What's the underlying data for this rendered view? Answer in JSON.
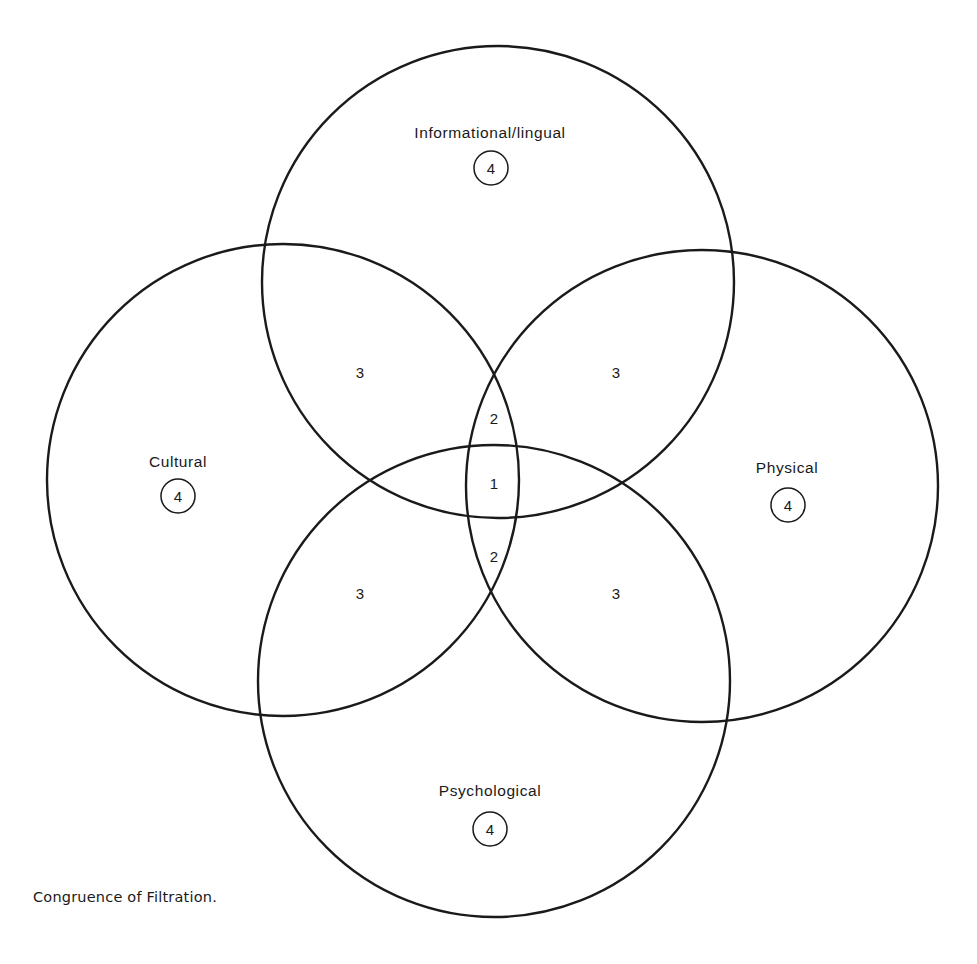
{
  "diagram": {
    "type": "venn",
    "caption": "Congruence of Filtration.",
    "line_color": "#1a1a1a",
    "background": "#ffffff",
    "sets": [
      {
        "id": "informational",
        "label": "Informational/lingual",
        "badge": "4",
        "cx": 498,
        "cy": 282,
        "r": 236,
        "label_x": 490,
        "label_y": 138,
        "badge_x": 491,
        "badge_y": 168
      },
      {
        "id": "cultural",
        "label": "Cultural",
        "badge": "4",
        "cx": 283,
        "cy": 480,
        "r": 236,
        "label_x": 178,
        "label_y": 467,
        "badge_x": 178,
        "badge_y": 496
      },
      {
        "id": "physical",
        "label": "Physical",
        "badge": "4",
        "cx": 702,
        "cy": 486,
        "r": 236,
        "label_x": 787,
        "label_y": 473,
        "badge_x": 788,
        "badge_y": 505
      },
      {
        "id": "psychological",
        "label": "Psychological",
        "badge": "4",
        "cx": 494,
        "cy": 681,
        "r": 236,
        "label_x": 490,
        "label_y": 796,
        "badge_x": 490,
        "badge_y": 829
      }
    ],
    "regions": [
      {
        "id": "info-cultural",
        "value": "3",
        "x": 360,
        "y": 372
      },
      {
        "id": "info-physical",
        "value": "3",
        "x": 616,
        "y": 372
      },
      {
        "id": "cultural-psych",
        "value": "3",
        "x": 360,
        "y": 593
      },
      {
        "id": "physical-psych",
        "value": "3",
        "x": 616,
        "y": 593
      },
      {
        "id": "triple-top",
        "value": "2",
        "x": 494,
        "y": 418
      },
      {
        "id": "all-four",
        "value": "1",
        "x": 494,
        "y": 483
      },
      {
        "id": "triple-bottom",
        "value": "2",
        "x": 494,
        "y": 556
      }
    ]
  }
}
